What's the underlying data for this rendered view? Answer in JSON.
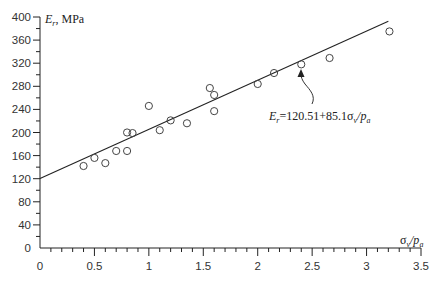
{
  "chart_data": {
    "type": "scatter",
    "title": "",
    "xlabel": "σv/pa",
    "xlabel_parts": {
      "sigma": "σ",
      "sub1": "v",
      "slash": "/p",
      "sub2": "a"
    },
    "ylabel": "Er, MPa",
    "ylabel_parts": {
      "main": "E",
      "sub": "r",
      "rest": ", MPa"
    },
    "xlim": [
      0,
      3.5
    ],
    "ylim": [
      0,
      400
    ],
    "grid": false,
    "x_ticks": [
      0,
      0.5,
      1,
      1.5,
      2,
      2.5,
      3,
      3.5
    ],
    "x_tick_labels": [
      "0",
      "0.5",
      "1",
      "1.5",
      "2",
      "2.5",
      "3",
      "3.5"
    ],
    "y_ticks": [
      0,
      40,
      80,
      120,
      160,
      200,
      240,
      280,
      320,
      360,
      400
    ],
    "y_tick_labels": [
      "0",
      "40",
      "80",
      "120",
      "160",
      "200",
      "240",
      "280",
      "320",
      "360",
      "400"
    ],
    "series": [
      {
        "name": "measured",
        "marker": "open-circle",
        "points": [
          [
            0.4,
            142
          ],
          [
            0.5,
            156
          ],
          [
            0.6,
            147
          ],
          [
            0.7,
            168
          ],
          [
            0.8,
            168
          ],
          [
            0.8,
            200
          ],
          [
            0.85,
            199
          ],
          [
            1.0,
            246
          ],
          [
            1.1,
            204
          ],
          [
            1.2,
            221
          ],
          [
            1.35,
            216
          ],
          [
            1.56,
            277
          ],
          [
            1.6,
            265
          ],
          [
            1.6,
            237
          ],
          [
            2.0,
            284
          ],
          [
            2.15,
            303
          ],
          [
            2.4,
            318
          ],
          [
            2.66,
            329
          ],
          [
            3.21,
            375
          ]
        ]
      },
      {
        "name": "fit",
        "type": "line",
        "intercept": 120.51,
        "slope": 85.1,
        "x_range": [
          0,
          3.2
        ]
      }
    ],
    "annotations": [
      {
        "text_parts": {
          "E": "E",
          "sub": "r",
          "eq": "=120.51+85.1",
          "sigma": "σ",
          "sub1": "v",
          "slash": "/p",
          "sub2": "a"
        },
        "text": "Er=120.51+85.1σv/pa",
        "points_to": [
          2.4,
          324
        ]
      }
    ]
  }
}
